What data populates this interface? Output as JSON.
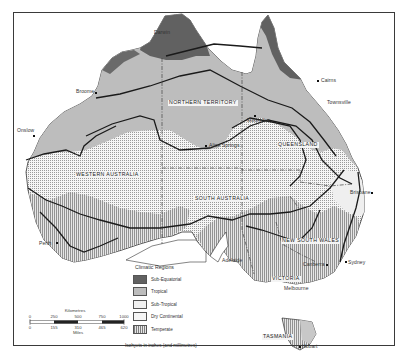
{
  "map": {
    "title": "Climatic Regions of Australia",
    "colors": {
      "sub_equatorial": "#5f5f5f",
      "tropical": "#b9b9b9",
      "sub_tropical": "#eeeeee",
      "dry_continental": "#f3f3f3",
      "temperate": "#dcdcdc",
      "isohyet_line": "#1a1a1a",
      "border_line": "#444444"
    },
    "states": [
      {
        "id": "nt",
        "label": "NORTHERN TERRITORY"
      },
      {
        "id": "qld",
        "label": "QUEENSLAND"
      },
      {
        "id": "wa",
        "label": "WESTERN AUSTRALIA"
      },
      {
        "id": "sa",
        "label": "SOUTH AUSTRALIA"
      },
      {
        "id": "nsw",
        "label": "NEW SOUTH WALES"
      },
      {
        "id": "vic",
        "label": "VICTORIA"
      },
      {
        "id": "tas",
        "label": "TASMANIA"
      }
    ],
    "cities": [
      {
        "id": "darwin",
        "label": "Darwin"
      },
      {
        "id": "cairns",
        "label": "Cairns"
      },
      {
        "id": "townsville",
        "label": "Townsville"
      },
      {
        "id": "broome",
        "label": "Broome"
      },
      {
        "id": "onslow",
        "label": "Onslow"
      },
      {
        "id": "mount-isa",
        "label": "Mount Isa"
      },
      {
        "id": "alice-springs",
        "label": "Alice Springs"
      },
      {
        "id": "brisbane",
        "label": "Brisbane"
      },
      {
        "id": "perth",
        "label": "Perth"
      },
      {
        "id": "adelaide",
        "label": "Adelaide"
      },
      {
        "id": "sydney",
        "label": "Sydney"
      },
      {
        "id": "canberra",
        "label": "Canberra"
      },
      {
        "id": "melbourne",
        "label": "Melbourne"
      },
      {
        "id": "hobart",
        "label": "Hobart"
      }
    ]
  },
  "legend": {
    "title": "Climatic Regions",
    "items": [
      {
        "id": "sub-equatorial",
        "label": "Sub-Equatorial"
      },
      {
        "id": "tropical",
        "label": "Tropical"
      },
      {
        "id": "sub-tropical",
        "label": "Sub-Tropical"
      },
      {
        "id": "dry-continental",
        "label": "Dry Continental"
      },
      {
        "id": "temperate",
        "label": "Temperate"
      }
    ]
  },
  "scale": {
    "km_label": "Kilometres",
    "km_ticks": [
      "0",
      "250",
      "500",
      "750",
      "1000"
    ],
    "mi_label": "Miles",
    "mi_ticks": [
      "0",
      "155",
      "310",
      "465",
      "620"
    ]
  },
  "footnote": "Isohyets in inches (and millimetres)"
}
